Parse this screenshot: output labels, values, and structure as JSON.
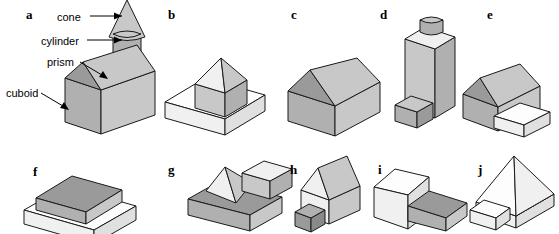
{
  "figure": {
    "background_color": "#ffffff",
    "line_color": "#1a1a1a",
    "fill_gray": "#b0b0b0",
    "fill_white": "#fdfdfd",
    "panel_letters": [
      "a",
      "b",
      "c",
      "d",
      "e",
      "f",
      "g",
      "h",
      "i",
      "j"
    ],
    "callouts": [
      {
        "label": "cone",
        "arrow": "horizontal-right"
      },
      {
        "label": "cylinder",
        "arrow": "horizontal-right"
      },
      {
        "label": "prism",
        "arrow": "diagonal-down-right"
      },
      {
        "label": "cuboid",
        "arrow": "diagonal-down-right"
      }
    ],
    "panels": [
      {
        "letter": "a",
        "parts": [
          "cuboid",
          "prism",
          "cylinder",
          "cone"
        ]
      },
      {
        "letter": "b",
        "parts": [
          "cuboid slab",
          "cube",
          "pyramid"
        ]
      },
      {
        "letter": "c",
        "parts": [
          "cuboid",
          "prism"
        ]
      },
      {
        "letter": "d",
        "parts": [
          "tall cuboid",
          "cylinder",
          "small cuboid"
        ]
      },
      {
        "letter": "e",
        "parts": [
          "cuboid",
          "prism",
          "cuboid extension"
        ]
      },
      {
        "letter": "f",
        "parts": [
          "cuboid slab",
          "cuboid slab"
        ]
      },
      {
        "letter": "g",
        "parts": [
          "cuboid slab",
          "pyramid",
          "cube"
        ]
      },
      {
        "letter": "h",
        "parts": [
          "cuboid",
          "prism",
          "small cuboid"
        ]
      },
      {
        "letter": "i",
        "parts": [
          "cuboid",
          "cuboid slab"
        ]
      },
      {
        "letter": "j",
        "parts": [
          "cuboid base",
          "pyramid",
          "small cuboid"
        ]
      }
    ]
  }
}
